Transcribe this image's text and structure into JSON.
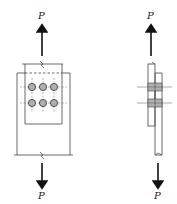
{
  "figure": {
    "type": "bolted lap joint under axial tension",
    "left_view": {
      "title": "plan view",
      "top_load_label": "P",
      "bottom_load_label": "P",
      "bolt_rows": 2,
      "bolt_cols": 3
    },
    "right_view": {
      "title": "side view",
      "top_load_label": "P",
      "bottom_load_label": "P",
      "bolt_count_visible": 2
    },
    "colors": {
      "line": "#333333",
      "bolt_fill": "#b0b0b0",
      "background": "#ffffff"
    }
  }
}
